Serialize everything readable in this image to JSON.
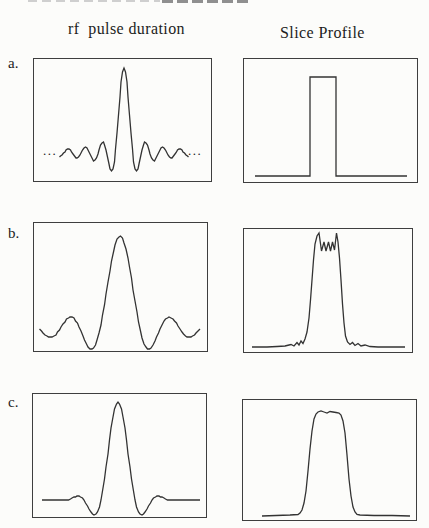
{
  "page": {
    "width": 429,
    "height": 528,
    "background": "#fcfcfa",
    "line_color": "#333333"
  },
  "header": {
    "rf_column": "rf  pulse duration",
    "profile_column": "Slice Profile"
  },
  "rows": [
    {
      "label": "a.",
      "rf": {
        "description": "long sinc rf pulse with many side lobes and tall narrow main lobe",
        "ellipsis_left": "...",
        "ellipsis_right": "..."
      },
      "profile": {
        "description": "ideal rectangular slice profile"
      }
    },
    {
      "label": "b.",
      "rf": {
        "description": "truncated sinc rf pulse with one side lobe on each side"
      },
      "profile": {
        "description": "near-rectangular slice profile with ringing on top and ripples at base"
      }
    },
    {
      "label": "c.",
      "rf": {
        "description": "apodized (smoothed) truncated sinc rf pulse with damped side lobes"
      },
      "profile": {
        "description": "smoothed rectangular slice profile with rounded flat top, no ringing"
      }
    }
  ],
  "chart_data": [
    {
      "id": "panel-a-rf",
      "row": "a",
      "column": "rf pulse duration",
      "type": "line",
      "shape": "sinc function, ~7 lobes per side, main peak near top of frame, ellipses indicate continuation",
      "box": {
        "left": 33,
        "top": 58,
        "width": 179,
        "height": 124
      },
      "gen": {
        "fn": "sinc",
        "cx": 91,
        "zeroY": 95,
        "amp": 85,
        "pxPerLobe": 8.6,
        "tMax": 7.52,
        "dt": 0.16,
        "window": 0
      }
    },
    {
      "id": "panel-a-profile",
      "row": "a",
      "column": "Slice Profile",
      "type": "line",
      "shape": "perfect boxcar: baseline with sharp-edged rectangle slightly left of centre",
      "box": {
        "left": 243,
        "top": 58,
        "width": 175,
        "height": 125
      },
      "gen": {
        "fn": "points",
        "points": [
          [
            12,
            118
          ],
          [
            67,
            118
          ],
          [
            67,
            19
          ],
          [
            93,
            19
          ],
          [
            93,
            118
          ],
          [
            164,
            118
          ]
        ]
      }
    },
    {
      "id": "panel-b-rf",
      "row": "b",
      "column": "rf pulse duration",
      "type": "line",
      "shape": "truncated sinc: central lobe plus single side lobe each side, ends near zero line",
      "box": {
        "left": 33,
        "top": 222,
        "width": 175,
        "height": 130
      },
      "gen": {
        "fn": "sinc",
        "cx": 87,
        "zeroY": 107,
        "amp": 93,
        "pxPerLobe": 20,
        "tMax": 4.02,
        "dt": 0.09,
        "window": 0
      }
    },
    {
      "id": "panel-b-profile",
      "row": "b",
      "column": "Slice Profile",
      "type": "line",
      "shape": "steep-sided profile with Gibbs ringing spikes across the top and small ripples at the feet",
      "box": {
        "left": 243,
        "top": 228,
        "width": 170,
        "height": 125
      },
      "gen": {
        "fn": "points",
        "points": [
          [
            9,
            119
          ],
          [
            24,
            119
          ],
          [
            34,
            118.5
          ],
          [
            42,
            118
          ],
          [
            48,
            116.5
          ],
          [
            51,
            118
          ],
          [
            54,
            114.5
          ],
          [
            56,
            117
          ],
          [
            58,
            113
          ],
          [
            60,
            115.5
          ],
          [
            62,
            111
          ],
          [
            64,
            104
          ],
          [
            66,
            90
          ],
          [
            67.5,
            72
          ],
          [
            69,
            52
          ],
          [
            70.5,
            32
          ],
          [
            72,
            16
          ],
          [
            74,
            8
          ],
          [
            76,
            5
          ],
          [
            78.5,
            23
          ],
          [
            81,
            14
          ],
          [
            83,
            23
          ],
          [
            85.5,
            14
          ],
          [
            87.5,
            23
          ],
          [
            89.5,
            14
          ],
          [
            91.5,
            22
          ],
          [
            93.5,
            5
          ],
          [
            95,
            14
          ],
          [
            96.5,
            30
          ],
          [
            98,
            52
          ],
          [
            99.5,
            76
          ],
          [
            101,
            95
          ],
          [
            102.5,
            108
          ],
          [
            104.5,
            114
          ],
          [
            107,
            116.5
          ],
          [
            109.5,
            114.5
          ],
          [
            112,
            117.5
          ],
          [
            115,
            115.5
          ],
          [
            118,
            118
          ],
          [
            122,
            117
          ],
          [
            127,
            118.5
          ],
          [
            135,
            119
          ],
          [
            162,
            119
          ]
        ]
      }
    },
    {
      "id": "panel-c-rf",
      "row": "c",
      "column": "rf pulse duration",
      "type": "line",
      "shape": "apodized sinc: central lobe with shallow smoothed side lobes flattening to zero at the ends",
      "box": {
        "left": 32,
        "top": 393,
        "width": 175,
        "height": 125
      },
      "gen": {
        "fn": "sinc",
        "cx": 86,
        "zeroY": 107,
        "amp": 98,
        "pxPerLobe": 17,
        "tMax": 3.8,
        "dt": 0.1,
        "window": 1,
        "flatTo": [
          10,
          168
        ]
      }
    },
    {
      "id": "panel-c-profile",
      "row": "c",
      "column": "Slice Profile",
      "type": "line",
      "shape": "smooth trapezoid-like profile with gently rounded slightly wavy flat top and smooth skirts",
      "box": {
        "left": 242,
        "top": 399,
        "width": 175,
        "height": 122
      },
      "gen": {
        "fn": "points",
        "points": [
          [
            20,
            117
          ],
          [
            34,
            116.5
          ],
          [
            48,
            116
          ],
          [
            56,
            115.5
          ],
          [
            58,
            114
          ],
          [
            60,
            111
          ],
          [
            62,
            104
          ],
          [
            64,
            92
          ],
          [
            66,
            72
          ],
          [
            68,
            50
          ],
          [
            70,
            32
          ],
          [
            72,
            20
          ],
          [
            74,
            15
          ],
          [
            76,
            13
          ],
          [
            79,
            12
          ],
          [
            82,
            13
          ],
          [
            85,
            14
          ],
          [
            88,
            12.5
          ],
          [
            91,
            13
          ],
          [
            94,
            13.5
          ],
          [
            97,
            14
          ],
          [
            99,
            16
          ],
          [
            101,
            22
          ],
          [
            103,
            34
          ],
          [
            105,
            56
          ],
          [
            107,
            80
          ],
          [
            109,
            97
          ],
          [
            111,
            108
          ],
          [
            113,
            113
          ],
          [
            115,
            115.5
          ],
          [
            118,
            116
          ],
          [
            132,
            116.5
          ],
          [
            150,
            116.5
          ],
          [
            168,
            117
          ]
        ]
      }
    }
  ]
}
